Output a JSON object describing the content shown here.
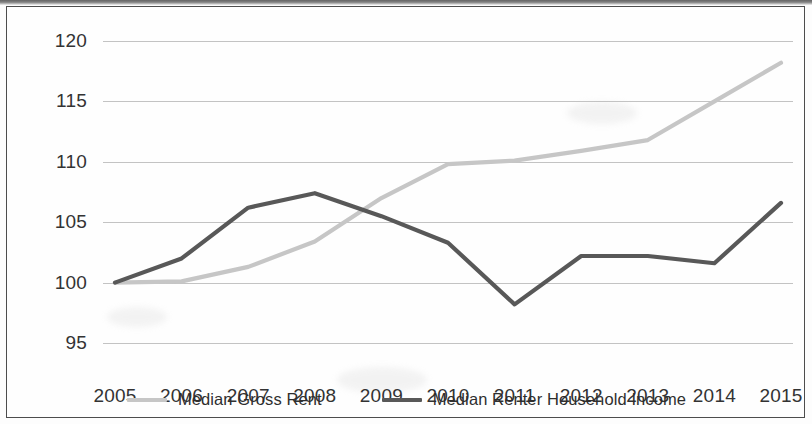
{
  "chart_data": {
    "type": "line",
    "title": "",
    "xlabel": "",
    "ylabel": "",
    "categories": [
      "2005",
      "2006",
      "2007",
      "2008",
      "2009",
      "2010",
      "2011",
      "2012",
      "2013",
      "2014",
      "2015"
    ],
    "ylim": [
      95,
      120
    ],
    "ytick_values": [
      95,
      100,
      105,
      110,
      115,
      120
    ],
    "ytick_labels": [
      "95",
      "100",
      "105",
      "110",
      "115",
      "120"
    ],
    "grid": true,
    "legend_position": "bottom",
    "series": [
      {
        "name": "Median Gross Rent",
        "color": "#c6c6c6",
        "values": [
          100.0,
          100.1,
          101.3,
          103.4,
          107.0,
          109.8,
          110.1,
          110.9,
          111.8,
          115.0,
          118.2
        ]
      },
      {
        "name": "Median Renter Household Income",
        "color": "#585858",
        "values": [
          100.0,
          102.0,
          106.2,
          107.4,
          105.5,
          103.3,
          98.2,
          102.2,
          102.2,
          101.6,
          106.6
        ]
      }
    ]
  },
  "legend": {
    "items": [
      {
        "label": "Median Gross Rent",
        "color": "#c6c6c6"
      },
      {
        "label": "Median Renter Household Income",
        "color": "#585858"
      }
    ]
  },
  "colors": {
    "rent_line": "#c6c6c6",
    "income_line": "#585858",
    "gridline": "#b9b9b9",
    "frame_border": "#4d4d4d",
    "text": "#333333",
    "background": "#fefefe"
  }
}
